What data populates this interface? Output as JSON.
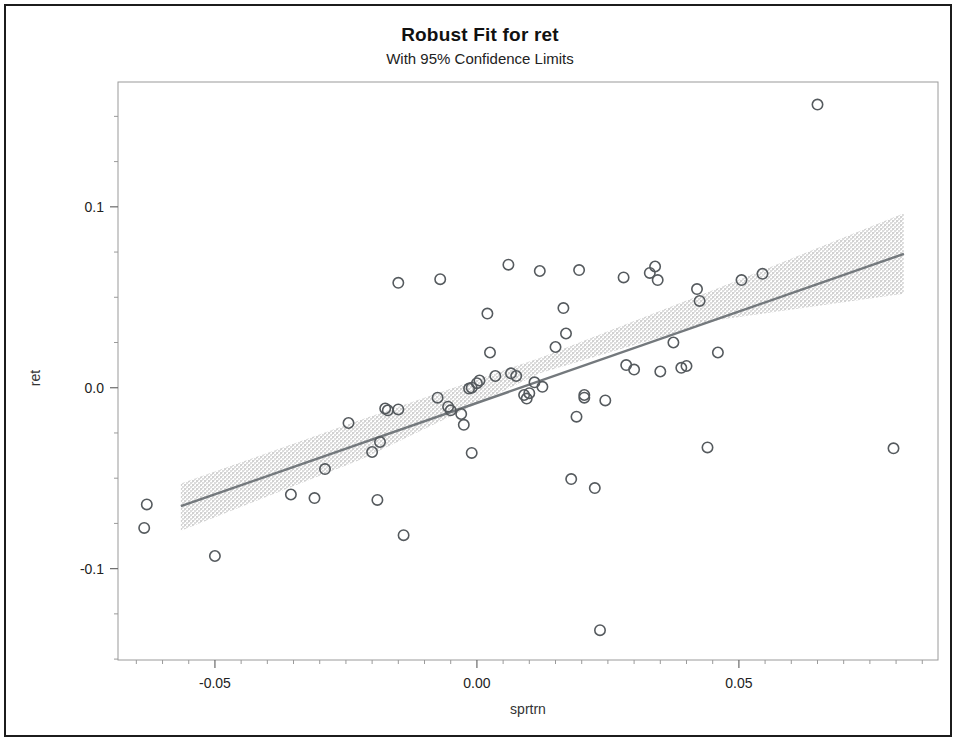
{
  "figure": {
    "title": "Robust Fit for ret",
    "subtitle": "With 95% Confidence Limits"
  },
  "chart_data": {
    "type": "scatter",
    "title": "Robust Fit for ret",
    "subtitle": "With 95% Confidence Limits",
    "xlabel": "sprtrn",
    "ylabel": "ret",
    "xlim": [
      -0.0685,
      0.088
    ],
    "ylim": [
      -0.1505,
      0.169
    ],
    "xticks": [
      -0.05,
      0.0,
      0.05
    ],
    "xtick_labels": [
      "-0.05",
      "0.00",
      "0.05"
    ],
    "xminor_ticks": [
      -0.065,
      -0.06,
      -0.055,
      -0.045,
      -0.04,
      -0.035,
      -0.03,
      -0.025,
      -0.02,
      -0.015,
      -0.01,
      -0.005,
      0.005,
      0.01,
      0.015,
      0.02,
      0.025,
      0.03,
      0.035,
      0.04,
      0.045,
      0.055,
      0.06,
      0.065,
      0.07,
      0.075,
      0.08,
      0.085
    ],
    "yticks": [
      0.1,
      0.0,
      -0.1
    ],
    "ytick_labels": [
      "0.1",
      "0.0",
      "-0.1"
    ],
    "yminor_ticks": [
      0.15,
      0.125,
      0.075,
      0.05,
      0.025,
      -0.025,
      -0.05,
      -0.075,
      -0.125,
      -0.15
    ],
    "grid": false,
    "legend": null,
    "marker": "open-circle",
    "marker_color": "#555a5e",
    "line_color": "#6e7478",
    "band_color": "#d9d9d9",
    "fit_line": {
      "name": "Robust fit",
      "x": [
        -0.0565,
        0.0815
      ],
      "y": [
        -0.0655,
        0.074
      ],
      "slope": 1.011,
      "intercept": -0.0084
    },
    "confidence_band": {
      "name": "95% Confidence Limits",
      "level": 0.95,
      "x": [
        -0.0565,
        -0.022,
        0.012,
        0.046,
        0.0815
      ],
      "upper": [
        -0.053,
        -0.0175,
        0.0165,
        0.055,
        0.0965
      ],
      "lower": [
        -0.079,
        -0.0395,
        0.008,
        0.0375,
        0.052
      ]
    },
    "points": [
      {
        "x": -0.063,
        "y": -0.0645
      },
      {
        "x": -0.0635,
        "y": -0.0775
      },
      {
        "x": -0.05,
        "y": -0.093
      },
      {
        "x": -0.0355,
        "y": -0.059
      },
      {
        "x": -0.031,
        "y": -0.061
      },
      {
        "x": -0.029,
        "y": -0.045
      },
      {
        "x": -0.0245,
        "y": -0.0195
      },
      {
        "x": -0.02,
        "y": -0.0355
      },
      {
        "x": -0.019,
        "y": -0.062
      },
      {
        "x": -0.0185,
        "y": -0.03
      },
      {
        "x": -0.0175,
        "y": -0.0115
      },
      {
        "x": -0.017,
        "y": -0.0125
      },
      {
        "x": -0.015,
        "y": -0.012
      },
      {
        "x": -0.015,
        "y": 0.058
      },
      {
        "x": -0.014,
        "y": -0.0815
      },
      {
        "x": -0.0075,
        "y": -0.0055
      },
      {
        "x": -0.007,
        "y": 0.06
      },
      {
        "x": -0.0055,
        "y": -0.0105
      },
      {
        "x": -0.005,
        "y": -0.0125
      },
      {
        "x": -0.003,
        "y": -0.0145
      },
      {
        "x": -0.0025,
        "y": -0.0205
      },
      {
        "x": -0.0015,
        "y": -0.0005
      },
      {
        "x": -0.001,
        "y": 0.0
      },
      {
        "x": -0.001,
        "y": -0.036
      },
      {
        "x": 0.0,
        "y": 0.0025
      },
      {
        "x": 0.0005,
        "y": 0.004
      },
      {
        "x": 0.002,
        "y": 0.041
      },
      {
        "x": 0.0025,
        "y": 0.0195
      },
      {
        "x": 0.0035,
        "y": 0.0065
      },
      {
        "x": 0.006,
        "y": 0.068
      },
      {
        "x": 0.0065,
        "y": 0.008
      },
      {
        "x": 0.0075,
        "y": 0.0065
      },
      {
        "x": 0.009,
        "y": -0.004
      },
      {
        "x": 0.0095,
        "y": -0.006
      },
      {
        "x": 0.01,
        "y": -0.003
      },
      {
        "x": 0.011,
        "y": 0.003
      },
      {
        "x": 0.012,
        "y": 0.0645
      },
      {
        "x": 0.0125,
        "y": 0.0005
      },
      {
        "x": 0.015,
        "y": 0.0225
      },
      {
        "x": 0.0165,
        "y": 0.044
      },
      {
        "x": 0.017,
        "y": 0.03
      },
      {
        "x": 0.018,
        "y": -0.0505
      },
      {
        "x": 0.019,
        "y": -0.016
      },
      {
        "x": 0.0195,
        "y": 0.065
      },
      {
        "x": 0.0205,
        "y": -0.004
      },
      {
        "x": 0.0205,
        "y": -0.0055
      },
      {
        "x": 0.0225,
        "y": -0.0555
      },
      {
        "x": 0.0235,
        "y": -0.134
      },
      {
        "x": 0.0245,
        "y": -0.007
      },
      {
        "x": 0.028,
        "y": 0.061
      },
      {
        "x": 0.0285,
        "y": 0.0125
      },
      {
        "x": 0.03,
        "y": 0.01
      },
      {
        "x": 0.033,
        "y": 0.0635
      },
      {
        "x": 0.034,
        "y": 0.067
      },
      {
        "x": 0.0345,
        "y": 0.0595
      },
      {
        "x": 0.035,
        "y": 0.009
      },
      {
        "x": 0.0375,
        "y": 0.025
      },
      {
        "x": 0.039,
        "y": 0.011
      },
      {
        "x": 0.04,
        "y": 0.012
      },
      {
        "x": 0.042,
        "y": 0.0545
      },
      {
        "x": 0.0425,
        "y": 0.048
      },
      {
        "x": 0.044,
        "y": -0.033
      },
      {
        "x": 0.046,
        "y": 0.0195
      },
      {
        "x": 0.0505,
        "y": 0.0595
      },
      {
        "x": 0.0545,
        "y": 0.063
      },
      {
        "x": 0.065,
        "y": 0.1565
      },
      {
        "x": 0.0795,
        "y": -0.0335
      }
    ]
  }
}
